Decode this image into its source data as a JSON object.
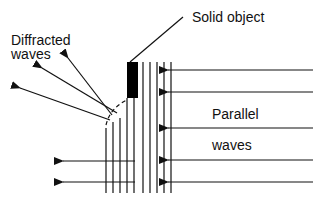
{
  "diagram": {
    "type": "wave-diffraction",
    "labels": {
      "solid_object": "Solid object",
      "diffracted_line1": "Diffracted",
      "diffracted_line2": "waves",
      "parallel_line1": "Parallel",
      "parallel_line2": "waves"
    },
    "colors": {
      "ink": "#111111",
      "object_fill": "#000000",
      "background": "#ffffff"
    },
    "elements": {
      "solid_object": {
        "x": 127,
        "y": 62,
        "width": 11,
        "height": 36
      },
      "wavefront_lines_x": [
        106,
        113,
        120,
        127,
        134,
        143,
        150,
        157,
        164,
        171
      ],
      "incoming_arrows_y": [
        70,
        92,
        128,
        160,
        182
      ],
      "outgoing_arrows_y": [
        161,
        182
      ],
      "diffracted_arrow_count": 3
    }
  }
}
